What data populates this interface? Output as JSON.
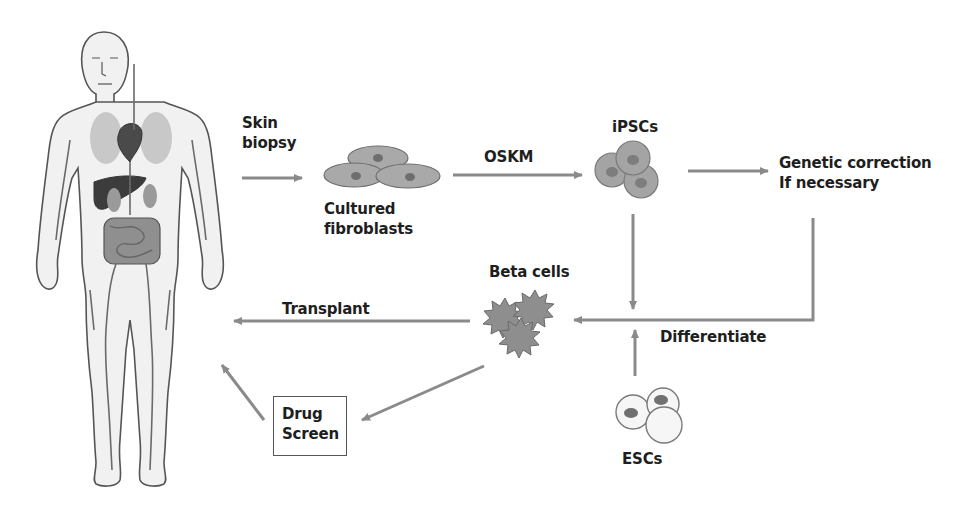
{
  "diagram": {
    "colors": {
      "arrow": "#8a8a8a",
      "cell_fill": "#a9a9a9",
      "cell_stroke": "#6e6e6e",
      "nucleus": "#7d7d7d",
      "text": "#1e1e1e"
    },
    "nodes": {
      "human_body": {
        "label": ""
      },
      "skin_biopsy": {
        "line1": "Skin",
        "line2": "biopsy"
      },
      "fibroblasts": {
        "line1": "Cultured",
        "line2": "fibroblasts"
      },
      "oskm": {
        "label": "OSKM"
      },
      "ipscs": {
        "label": "iPSCs"
      },
      "genetic_correction": {
        "line1": "Genetic correction",
        "line2": "If necessary"
      },
      "beta_cells": {
        "label": "Beta cells"
      },
      "differentiate": {
        "label": "Differentiate"
      },
      "transplant": {
        "label": "Transplant"
      },
      "drug_screen": {
        "line1": "Drug",
        "line2": "Screen"
      },
      "escs": {
        "label": "ESCs"
      }
    },
    "edges": [
      {
        "from": "human_body",
        "to": "fibroblasts",
        "label": "Skin biopsy"
      },
      {
        "from": "fibroblasts",
        "to": "ipscs",
        "label": "OSKM"
      },
      {
        "from": "ipscs",
        "to": "genetic_correction",
        "label": ""
      },
      {
        "from": "genetic_correction",
        "to": "beta_cells",
        "label": "Differentiate"
      },
      {
        "from": "ipscs",
        "to": "beta_cells",
        "label": "Differentiate"
      },
      {
        "from": "escs",
        "to": "beta_cells",
        "label": "Differentiate"
      },
      {
        "from": "beta_cells",
        "to": "human_body",
        "label": "Transplant"
      },
      {
        "from": "beta_cells",
        "to": "drug_screen",
        "label": ""
      },
      {
        "from": "drug_screen",
        "to": "human_body",
        "label": ""
      }
    ]
  }
}
